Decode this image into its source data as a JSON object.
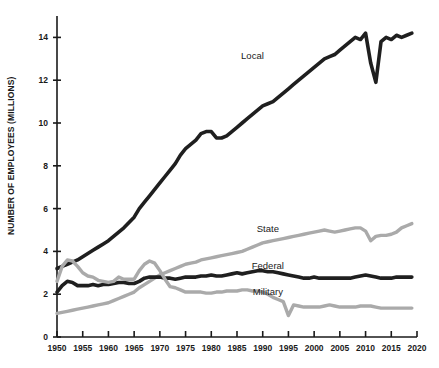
{
  "chart_data": {
    "type": "line",
    "title": "",
    "xlabel": "",
    "ylabel": "NUMBER OF EMPLOYEES (MILLIONS)",
    "xlim": [
      1950,
      2020
    ],
    "ylim": [
      0,
      15
    ],
    "grid": false,
    "legend_position": "inline-labels",
    "x_ticks": [
      1950,
      1955,
      1960,
      1965,
      1970,
      1975,
      1980,
      1985,
      1990,
      1995,
      2000,
      2005,
      2010,
      2015,
      2020
    ],
    "x_tick_labels": [
      "1950",
      "1955",
      "1960",
      "1965",
      "1970",
      "1975",
      "1980",
      "1985",
      "1990",
      "1995",
      "2000",
      "2005",
      "2010",
      "2015",
      "2020"
    ],
    "y_ticks": [
      0,
      2,
      4,
      6,
      8,
      10,
      12,
      14
    ],
    "y_tick_labels": [
      "0",
      "2",
      "4",
      "6",
      "8",
      "10",
      "12",
      "14"
    ],
    "colors": {
      "local": "#1f1f1f",
      "federal": "#1f1f1f",
      "state": "#aaaaaa",
      "military": "#aaaaaa",
      "axis": "#1a1a1a",
      "background": "#ffffff"
    },
    "series": [
      {
        "name": "Local",
        "color": "#1f1f1f",
        "label_x": 1988,
        "label_y": 13.0,
        "x": [
          1950,
          1951,
          1952,
          1953,
          1954,
          1955,
          1956,
          1957,
          1958,
          1959,
          1960,
          1961,
          1962,
          1963,
          1964,
          1965,
          1966,
          1967,
          1968,
          1969,
          1970,
          1971,
          1972,
          1973,
          1974,
          1975,
          1976,
          1977,
          1978,
          1979,
          1980,
          1981,
          1982,
          1983,
          1984,
          1985,
          1986,
          1987,
          1988,
          1989,
          1990,
          1991,
          1992,
          1993,
          1994,
          1995,
          1996,
          1997,
          1998,
          1999,
          2000,
          2001,
          2002,
          2003,
          2004,
          2005,
          2006,
          2007,
          2008,
          2009,
          2010,
          2011,
          2012,
          2013,
          2014,
          2015,
          2016,
          2017,
          2018,
          2019
        ],
        "values": [
          3.2,
          3.3,
          3.4,
          3.5,
          3.6,
          3.75,
          3.9,
          4.05,
          4.2,
          4.35,
          4.5,
          4.7,
          4.9,
          5.1,
          5.35,
          5.6,
          6.0,
          6.3,
          6.6,
          6.9,
          7.2,
          7.5,
          7.8,
          8.1,
          8.5,
          8.8,
          9.0,
          9.2,
          9.5,
          9.6,
          9.6,
          9.3,
          9.3,
          9.4,
          9.6,
          9.8,
          10.0,
          10.2,
          10.4,
          10.6,
          10.8,
          10.9,
          11.0,
          11.2,
          11.4,
          11.6,
          11.8,
          12.0,
          12.2,
          12.4,
          12.6,
          12.8,
          13.0,
          13.1,
          13.2,
          13.4,
          13.6,
          13.8,
          14.0,
          13.9,
          14.2,
          12.8,
          11.9,
          13.8,
          14.0,
          13.9,
          14.1,
          14.0,
          14.1,
          14.2
        ]
      },
      {
        "name": "State",
        "color": "#aaaaaa",
        "label_x": 1991,
        "label_y": 4.9,
        "x": [
          1950,
          1951,
          1952,
          1953,
          1954,
          1955,
          1956,
          1957,
          1958,
          1959,
          1960,
          1961,
          1962,
          1963,
          1964,
          1965,
          1966,
          1967,
          1968,
          1969,
          1970,
          1971,
          1972,
          1973,
          1974,
          1975,
          1976,
          1977,
          1978,
          1979,
          1980,
          1981,
          1982,
          1983,
          1984,
          1985,
          1986,
          1987,
          1988,
          1989,
          1990,
          1991,
          1992,
          1993,
          1994,
          1995,
          1996,
          1997,
          1998,
          1999,
          2000,
          2001,
          2002,
          2003,
          2004,
          2005,
          2006,
          2007,
          2008,
          2009,
          2010,
          2011,
          2012,
          2013,
          2014,
          2015,
          2016,
          2017,
          2018,
          2019
        ],
        "values": [
          1.1,
          1.15,
          1.2,
          1.25,
          1.3,
          1.35,
          1.4,
          1.45,
          1.5,
          1.55,
          1.6,
          1.7,
          1.8,
          1.9,
          2.0,
          2.1,
          2.3,
          2.45,
          2.6,
          2.75,
          2.9,
          3.0,
          3.1,
          3.2,
          3.3,
          3.4,
          3.45,
          3.5,
          3.6,
          3.65,
          3.7,
          3.75,
          3.8,
          3.85,
          3.9,
          3.95,
          4.0,
          4.1,
          4.2,
          4.3,
          4.4,
          4.45,
          4.5,
          4.55,
          4.6,
          4.65,
          4.7,
          4.75,
          4.8,
          4.85,
          4.9,
          4.95,
          5.0,
          4.95,
          4.9,
          4.95,
          5.0,
          5.05,
          5.1,
          5.1,
          4.95,
          4.5,
          4.7,
          4.75,
          4.75,
          4.8,
          4.9,
          5.1,
          5.2,
          5.3
        ]
      },
      {
        "name": "Federal",
        "color": "#1f1f1f",
        "label_x": 1991,
        "label_y": 3.2,
        "x": [
          1950,
          1951,
          1952,
          1953,
          1954,
          1955,
          1956,
          1957,
          1958,
          1959,
          1960,
          1961,
          1962,
          1963,
          1964,
          1965,
          1966,
          1967,
          1968,
          1969,
          1970,
          1971,
          1972,
          1973,
          1974,
          1975,
          1976,
          1977,
          1978,
          1979,
          1980,
          1981,
          1982,
          1983,
          1984,
          1985,
          1986,
          1987,
          1988,
          1989,
          1990,
          1991,
          1992,
          1993,
          1994,
          1995,
          1996,
          1997,
          1998,
          1999,
          2000,
          2001,
          2002,
          2003,
          2004,
          2005,
          2006,
          2007,
          2008,
          2009,
          2010,
          2011,
          2012,
          2013,
          2014,
          2015,
          2016,
          2017,
          2018,
          2019
        ],
        "values": [
          2.1,
          2.4,
          2.6,
          2.55,
          2.4,
          2.4,
          2.4,
          2.45,
          2.4,
          2.45,
          2.45,
          2.5,
          2.55,
          2.55,
          2.5,
          2.5,
          2.6,
          2.75,
          2.8,
          2.8,
          2.8,
          2.75,
          2.75,
          2.7,
          2.75,
          2.8,
          2.8,
          2.8,
          2.85,
          2.85,
          2.9,
          2.85,
          2.85,
          2.9,
          2.95,
          3.0,
          2.95,
          3.0,
          3.05,
          3.1,
          3.1,
          3.05,
          3.05,
          3.0,
          2.95,
          2.9,
          2.85,
          2.8,
          2.75,
          2.75,
          2.8,
          2.75,
          2.75,
          2.75,
          2.75,
          2.75,
          2.75,
          2.75,
          2.8,
          2.85,
          2.9,
          2.85,
          2.8,
          2.75,
          2.75,
          2.75,
          2.8,
          2.8,
          2.8,
          2.8
        ]
      },
      {
        "name": "Military",
        "color": "#aaaaaa",
        "label_x": 1991,
        "label_y": 1.95,
        "x": [
          1950,
          1951,
          1952,
          1953,
          1954,
          1955,
          1956,
          1957,
          1958,
          1959,
          1960,
          1961,
          1962,
          1963,
          1964,
          1965,
          1966,
          1967,
          1968,
          1969,
          1970,
          1971,
          1972,
          1973,
          1974,
          1975,
          1976,
          1977,
          1978,
          1979,
          1980,
          1981,
          1982,
          1983,
          1984,
          1985,
          1986,
          1987,
          1988,
          1989,
          1990,
          1991,
          1992,
          1993,
          1994,
          1995,
          1996,
          1997,
          1998,
          1999,
          2000,
          2001,
          2002,
          2003,
          2004,
          2005,
          2006,
          2007,
          2008,
          2009,
          2010,
          2011,
          2012,
          2013,
          2014,
          2015,
          2016,
          2017,
          2018,
          2019
        ],
        "values": [
          2.6,
          3.3,
          3.6,
          3.55,
          3.3,
          3.0,
          2.85,
          2.8,
          2.65,
          2.6,
          2.55,
          2.6,
          2.8,
          2.7,
          2.7,
          2.7,
          3.1,
          3.4,
          3.55,
          3.45,
          3.1,
          2.7,
          2.35,
          2.3,
          2.2,
          2.1,
          2.1,
          2.1,
          2.1,
          2.05,
          2.05,
          2.1,
          2.1,
          2.15,
          2.15,
          2.15,
          2.2,
          2.2,
          2.15,
          2.15,
          2.1,
          2.0,
          1.85,
          1.75,
          1.65,
          1.0,
          1.5,
          1.45,
          1.4,
          1.4,
          1.4,
          1.4,
          1.45,
          1.5,
          1.45,
          1.4,
          1.4,
          1.4,
          1.4,
          1.45,
          1.45,
          1.45,
          1.4,
          1.35,
          1.35,
          1.35,
          1.35,
          1.35,
          1.35,
          1.35
        ]
      }
    ]
  }
}
